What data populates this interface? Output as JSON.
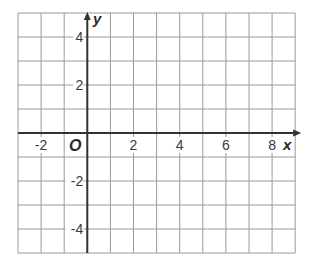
{
  "chart_data": {
    "type": "coordinate-grid",
    "title": "",
    "xlabel": "x",
    "ylabel": "y",
    "origin_label": "O",
    "xlim": [
      -3,
      9
    ],
    "ylim": [
      -5,
      5
    ],
    "grid": true,
    "grid_step": 1,
    "x_ticks": [
      {
        "value": -2,
        "label": "-2"
      },
      {
        "value": 2,
        "label": "2"
      },
      {
        "value": 4,
        "label": "4"
      },
      {
        "value": 6,
        "label": "6"
      },
      {
        "value": 8,
        "label": "8"
      }
    ],
    "y_ticks": [
      {
        "value": 4,
        "label": "4"
      },
      {
        "value": 2,
        "label": "2"
      },
      {
        "value": -2,
        "label": "-2"
      },
      {
        "value": -4,
        "label": "-4"
      }
    ],
    "series": []
  },
  "colors": {
    "grid": "#9a9a9a",
    "axis": "#333333",
    "text": "#3a3a3a",
    "background": "#ffffff"
  }
}
